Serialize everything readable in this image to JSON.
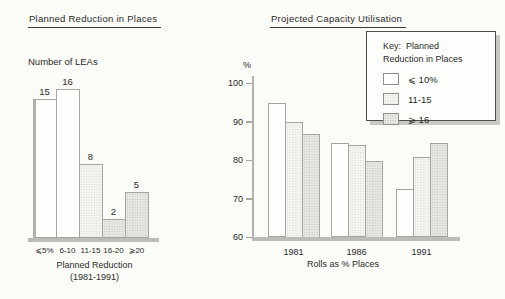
{
  "figure": {
    "background": "#fbfbf8",
    "colors": {
      "axis_gray": "#bcbcb6",
      "bar_outline": "#a5a59f",
      "text": "#2b2b29",
      "fill_plain": "#fefefc",
      "fill_light": "#f4f4f0",
      "fill_dark": "#e8e8e3"
    }
  },
  "chart_data": [
    {
      "type": "bar",
      "title": "Planned Reduction in Places",
      "ylabel": "Number of LEAs",
      "xlabel": "Planned Reduction",
      "xlabel_note": "(1981-1991)",
      "categories": [
        "⩽5%",
        "6-10",
        "11-15",
        "16-20",
        "⩾20"
      ],
      "values": [
        15,
        16,
        8,
        2,
        5
      ],
      "bar_styles": [
        "plain",
        "plain",
        "light",
        "dark",
        "dark"
      ],
      "yaxis_shown": false,
      "value_labels_shown": true,
      "grid": false
    },
    {
      "type": "grouped-bar",
      "title": "Projected Capacity Utilisation",
      "ylabel": "%",
      "xlabel": "Rolls as % Places",
      "categories": [
        "1981",
        "1986",
        "1991"
      ],
      "series": [
        {
          "name": "⩽ 10%",
          "style": "plain",
          "values": [
            95,
            84.5,
            72.5
          ]
        },
        {
          "name": "11-15",
          "style": "light",
          "values": [
            90,
            84,
            81
          ]
        },
        {
          "name": "⩾ 16",
          "style": "dark",
          "values": [
            87,
            80,
            84.5
          ]
        }
      ],
      "ylim": [
        60,
        100
      ],
      "yticks": [
        100,
        90,
        80,
        70,
        60
      ],
      "grid": false,
      "legend": {
        "title_line1": "Key:  Planned",
        "title_line2": "Reduction in Places",
        "position": "top-right"
      }
    }
  ]
}
